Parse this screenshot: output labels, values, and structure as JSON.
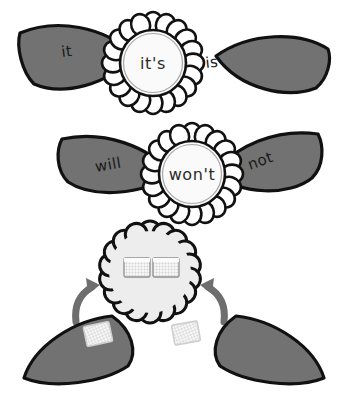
{
  "page": {
    "background_color": "#ffffff",
    "width": 348,
    "height": 401
  },
  "colors": {
    "leaf_fill": "#727272",
    "leaf_outline": "#111111",
    "flower_petal_fill": "#ffffff",
    "flower_petal_outline": "#111111",
    "flower_center_fill": "#fafafa",
    "flower_center_outline": "#8c8c8c",
    "cloud_fill": "#ededed",
    "cloud_outline": "#111111",
    "arrow_fill": "#6e6e6e",
    "text_color": "#1a1a1a",
    "card_fill": "#f7f7f7",
    "card_outline": "#9a9a9a"
  },
  "rows": [
    {
      "id": "row-its",
      "left_leaf_word": "it",
      "right_leaf_word": "is",
      "center_word": "it's",
      "filled": true
    },
    {
      "id": "row-wont",
      "left_leaf_word": "will",
      "right_leaf_word": "not",
      "center_word": "won't",
      "filled": true
    },
    {
      "id": "row-blank",
      "left_leaf_word": "",
      "right_leaf_word": "",
      "center_word": "",
      "filled": false,
      "arrows": [
        "arrow-left-up",
        "arrow-right-up"
      ],
      "blank_cards": [
        "blank-card-left",
        "blank-card-right"
      ]
    }
  ]
}
